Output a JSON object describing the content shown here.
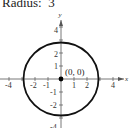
{
  "title": "Radius:  3",
  "graph": {
    "x_axis_label": "x",
    "y_axis_label": "y",
    "x_ticks": [
      {
        "value": -4,
        "label": "-4"
      },
      {
        "value": -2,
        "label": "-2"
      },
      {
        "value": -1,
        "label": "-1"
      },
      {
        "value": 1,
        "label": "1"
      },
      {
        "value": 2,
        "label": "2"
      },
      {
        "value": 4,
        "label": "4"
      }
    ],
    "y_ticks": [
      {
        "value": 4,
        "label": "4"
      },
      {
        "value": 2,
        "label": "2"
      },
      {
        "value": 1,
        "label": "1"
      },
      {
        "value": -1,
        "label": "-1"
      },
      {
        "value": -2,
        "label": "-2"
      },
      {
        "value": -4,
        "label": "-4"
      }
    ],
    "circle": {
      "center_x": 0,
      "center_y": 0,
      "radius": 3
    },
    "center_point_label": "(0, 0)"
  }
}
